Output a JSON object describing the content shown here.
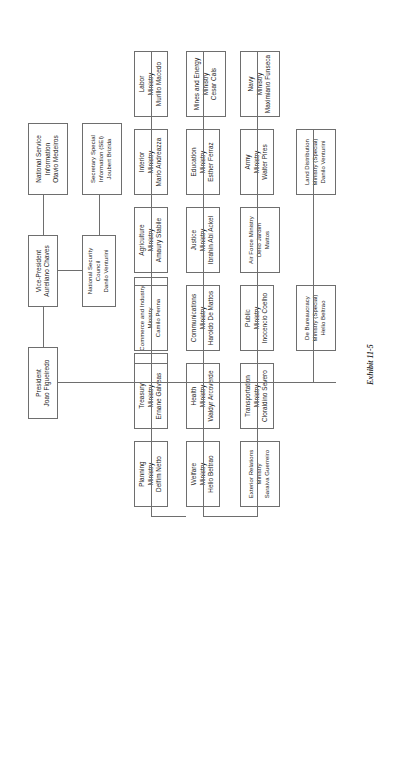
{
  "chart": {
    "type": "org-chart",
    "caption": "Exhibit 11-5",
    "orientation": "rotated-90-counterclockwise",
    "root": {
      "id": "president",
      "title": "President",
      "name": "Joao Figueiredo"
    },
    "deputy": {
      "id": "vice-president",
      "title": "Vice-President",
      "name": "Aureliano Chaves"
    },
    "nodes": [
      {
        "id": "civil-cabinet",
        "title": "Civil",
        "subtitle": "Cabinet",
        "name": "Leitao De Abreu"
      },
      {
        "id": "military-cabinet",
        "title": "Military",
        "subtitle": "Cabinet",
        "name": "Ruben Ludwig"
      },
      {
        "id": "national-security-council",
        "title": "National Security",
        "subtitle": "Council",
        "name": "Danilo Venturini"
      },
      {
        "id": "national-service-information",
        "title": "National Service",
        "subtitle": "Information",
        "name": "Otavio Medeiros"
      },
      {
        "id": "secretary-special-information",
        "title": "Secretary Special",
        "subtitle": "Information (SEI)",
        "name": "Joubert Brizida"
      },
      {
        "id": "planning-ministry",
        "title": "Planning",
        "subtitle": "Ministry",
        "name": "Delfim Netto"
      },
      {
        "id": "treasury-ministry",
        "title": "Treasury",
        "subtitle": "Ministry",
        "name": "Ernane Galveas"
      },
      {
        "id": "commerce-industry-ministry",
        "title": "Commerce and Industry",
        "subtitle": "Ministry",
        "name": "Camilo Penna"
      },
      {
        "id": "agriculture-ministry",
        "title": "Agriculture",
        "subtitle": "Ministry",
        "name": "Amaury Stabile"
      },
      {
        "id": "interior-ministry",
        "title": "Interior",
        "subtitle": "Ministry",
        "name": "Mario Andreazza"
      },
      {
        "id": "labor-ministry",
        "title": "Labor",
        "subtitle": "Ministry",
        "name": "Murillo Macedo"
      },
      {
        "id": "welfare-ministry",
        "title": "Welfare",
        "subtitle": "Ministry",
        "name": "Helio Beltrao"
      },
      {
        "id": "health-ministry",
        "title": "Health",
        "subtitle": "Ministry",
        "name": "Waldyr Arcoverde"
      },
      {
        "id": "communications-ministry",
        "title": "Communications",
        "subtitle": "Ministry",
        "name": "Haroldo De Mattos"
      },
      {
        "id": "justice-ministry",
        "title": "Justice",
        "subtitle": "Ministry",
        "name": "Ibrahin Abi Ackel"
      },
      {
        "id": "education-ministry",
        "title": "Education",
        "subtitle": "Ministry",
        "name": "Esther Ferraz"
      },
      {
        "id": "mines-energy-ministry",
        "title": "Mines and Energy",
        "subtitle": "Ministry",
        "name": "Cesar Cals"
      },
      {
        "id": "exterior-relations-ministry",
        "title": "Exterior Relations",
        "subtitle": "Ministry",
        "name": "Saraiva Guerreiro"
      },
      {
        "id": "transportation-ministry",
        "title": "Transportation",
        "subtitle": "Ministry",
        "name": "Cloraldino Severo"
      },
      {
        "id": "public-ministry",
        "title": "Public",
        "subtitle": "Ministry",
        "name": "Inocencio Coelho"
      },
      {
        "id": "air-force-ministry",
        "title": "Air Force Ministry",
        "subtitle": "Delio Jardim",
        "name": "Mattos"
      },
      {
        "id": "army-ministry",
        "title": "Army",
        "subtitle": "Ministry",
        "name": "Walter Pires"
      },
      {
        "id": "navy-ministry",
        "title": "Navy",
        "subtitle": "Ministry",
        "name": "Maximiano Funseca"
      },
      {
        "id": "de-bureaucracy-ministry",
        "title": "De Bureaucracy",
        "subtitle": "Ministry (Special)",
        "name": "Helio Beltrao"
      },
      {
        "id": "land-distribution-ministry",
        "title": "Land Distribution",
        "subtitle": "Ministry (Special)",
        "name": "Danilo Venturini"
      }
    ]
  }
}
